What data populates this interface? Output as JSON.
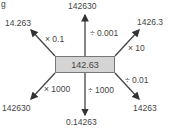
{
  "figure": {
    "label": "g",
    "center_value": "142.63",
    "arrows": [
      {
        "direction": "up",
        "operation": "÷ 0.001",
        "result": "142630"
      },
      {
        "direction": "up-left",
        "operation": "× 0.1",
        "result": "14.263"
      },
      {
        "direction": "up-right",
        "operation": "× 10",
        "result": "1426.3"
      },
      {
        "direction": "down-right",
        "operation": "÷ 0.01",
        "result": "14263"
      },
      {
        "direction": "down",
        "operation": "÷ 1000",
        "result": "0.14263"
      },
      {
        "direction": "down-left",
        "operation": "× 1000",
        "result": "142630"
      }
    ]
  }
}
